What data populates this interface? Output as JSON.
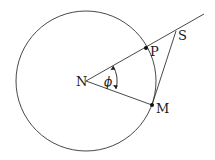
{
  "diagram": {
    "type": "geometry",
    "circle": {
      "cx": 86,
      "cy": 81,
      "r": 70
    },
    "points": {
      "N": {
        "label": "N",
        "x": 86,
        "y": 81
      },
      "P": {
        "label": "P",
        "x": 146,
        "y": 48
      },
      "M": {
        "label": "M",
        "x": 152,
        "y": 105
      },
      "S": {
        "label": "S",
        "x": 176,
        "y": 31
      }
    },
    "angle": {
      "label": "ϕ",
      "vertex": "N",
      "between": [
        "P",
        "M"
      ]
    },
    "segments": [
      [
        "N",
        "ray-beyond-S"
      ],
      [
        "N",
        "M"
      ],
      [
        "M",
        "S"
      ]
    ],
    "colors": {
      "stroke": "#333333",
      "point": "#111111"
    }
  }
}
